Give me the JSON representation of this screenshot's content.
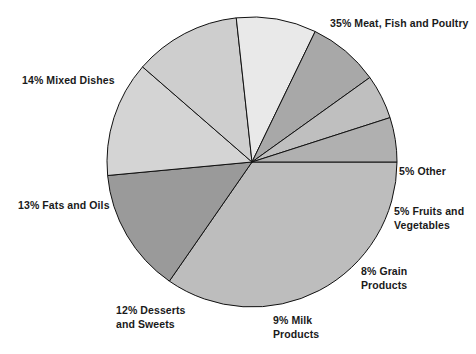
{
  "chart_data": {
    "type": "pie",
    "title": "",
    "subtitle": "",
    "xlabel": "",
    "ylabel": "",
    "legend_position": "none",
    "grid": false,
    "units": "percent",
    "start_angle_deg": 0,
    "direction": "clockwise",
    "categories": [
      "Meat, Fish and Poultry",
      "Mixed Dishes",
      "Fats and Oils",
      "Desserts and Sweets",
      "Milk Products",
      "Grain Products",
      "Fruits and Vegetables",
      "Other"
    ],
    "values": [
      35,
      14,
      13,
      12,
      9,
      8,
      5,
      5
    ],
    "slices": [
      {
        "label": "Meat, Fish and Poultry",
        "value": 35,
        "color": "#bdbdbd"
      },
      {
        "label": "Mixed Dishes",
        "value": 14,
        "color": "#9a9a9a"
      },
      {
        "label": "Fats and Oils",
        "value": 13,
        "color": "#d4d4d4"
      },
      {
        "label": "Desserts and Sweets",
        "value": 12,
        "color": "#cecece"
      },
      {
        "label": "Milk Products",
        "value": 9,
        "color": "#e9e9e9"
      },
      {
        "label": "Grain Products",
        "value": 8,
        "color": "#a8a8a8"
      },
      {
        "label": "Fruits and Vegetables",
        "value": 5,
        "color": "#bfbfbf"
      },
      {
        "label": "Other",
        "value": 5,
        "color": "#b0b0b0"
      }
    ]
  },
  "labels": {
    "meat": "35% Meat, Fish and Poultry",
    "mixed": "14% Mixed Dishes",
    "fats": "13% Fats and Oils",
    "desserts": "12% Desserts\nand Sweets",
    "milk": "9% Milk\nProducts",
    "grain": "8% Grain\nProducts",
    "fruits": "5% Fruits and\nVegetables",
    "other": "5% Other"
  },
  "geometry": {
    "center_x": 252,
    "center_y": 162,
    "radius": 145,
    "stroke_color": "#111111",
    "stroke_width": 1
  }
}
